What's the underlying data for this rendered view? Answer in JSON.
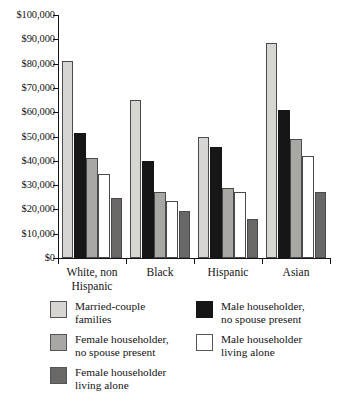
{
  "chart_data": {
    "type": "bar",
    "title": "",
    "subtitle": "",
    "xlabel": "",
    "ylabel": "",
    "ylim": [
      0,
      100000
    ],
    "grid": false,
    "legend_position": "bottom",
    "y_tick_labels": [
      "$100,000",
      "$90,000",
      "$80,000",
      "$70,000",
      "$60,000",
      "$50,000",
      "$40,000",
      "$30,000",
      "$20,000",
      "$10,000",
      "$0"
    ],
    "y_tick_values": [
      100000,
      90000,
      80000,
      70000,
      60000,
      50000,
      40000,
      30000,
      20000,
      10000,
      0
    ],
    "categories": [
      "White, non\nHispanic",
      "Black",
      "Hispanic",
      "Asian"
    ],
    "category_labels_plain": [
      "White, non Hispanic",
      "Black",
      "Hispanic",
      "Asian"
    ],
    "series": [
      {
        "name": "Married-couple\nfamilies",
        "name_plain": "Married-couple families",
        "color": "#d8d6d2",
        "values": [
          81000,
          65000,
          50000,
          88500
        ]
      },
      {
        "name": "Male householder,\nno spouse present",
        "name_plain": "Male householder, no spouse present",
        "color": "#161616",
        "values": [
          51500,
          40000,
          45500,
          61000
        ]
      },
      {
        "name": "Female householder,\nno spouse present",
        "name_plain": "Female householder, no spouse present",
        "color": "#a9a7a3",
        "values": [
          41000,
          27000,
          29000,
          49000
        ]
      },
      {
        "name": "Male householder\nliving alone",
        "name_plain": "Male householder living alone",
        "color": "#ffffff",
        "values": [
          34500,
          23500,
          27000,
          42000
        ]
      },
      {
        "name": "Female householder\nliving alone",
        "name_plain": "Female householder living alone",
        "color": "#6a6866",
        "values": [
          24500,
          19500,
          16000,
          27000
        ]
      }
    ]
  },
  "legend": {
    "entries": [
      {
        "label": "Married-couple\nfamilies",
        "color": "#d8d6d2"
      },
      {
        "label": "Male householder,\nno spouse present",
        "color": "#161616"
      },
      {
        "label": "Female householder,\nno spouse present",
        "color": "#a9a7a3"
      },
      {
        "label": "Male householder\nliving alone",
        "color": "#ffffff"
      },
      {
        "label": "Female householder\nliving alone",
        "color": "#6a6866"
      }
    ]
  },
  "colors": {
    "axis": "#141414",
    "bar_outline": "#4a4a4a",
    "background": "#ffffff",
    "married_couple": "#d8d6d2",
    "male_no_spouse": "#161616",
    "female_no_spouse": "#a9a7a3",
    "male_living_alone": "#ffffff",
    "female_living_alone": "#6a6866"
  }
}
